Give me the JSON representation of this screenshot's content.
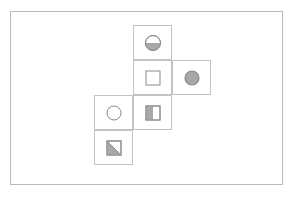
{
  "figure": {
    "title": "",
    "frame": {
      "border_color": "#b9b9b9",
      "background": "#ffffff",
      "x": 10,
      "y": 11,
      "width": 273,
      "height": 174
    },
    "cell": {
      "width": 39,
      "height": 35,
      "border_color": "#c3c3c3"
    },
    "grid_origin": {
      "x": 94,
      "y": 25
    },
    "colors": {
      "shape_outline": "#8a8a8a",
      "shape_fill": "#a8a8a8",
      "empty_fill": "#ffffff"
    },
    "cells": [
      {
        "id": "cell-r0c1",
        "row": 0,
        "col": 1,
        "shape": "circle",
        "fill_style": "bottom-half",
        "label": "half-filled-circle"
      },
      {
        "id": "cell-r1c1",
        "row": 1,
        "col": 1,
        "shape": "square",
        "fill_style": "none",
        "label": "empty-square"
      },
      {
        "id": "cell-r1c2",
        "row": 1,
        "col": 2,
        "shape": "circle",
        "fill_style": "full",
        "label": "filled-circle"
      },
      {
        "id": "cell-r2c0",
        "row": 2,
        "col": 0,
        "shape": "circle",
        "fill_style": "none",
        "label": "empty-circle"
      },
      {
        "id": "cell-r2c1",
        "row": 2,
        "col": 1,
        "shape": "square",
        "fill_style": "left-half",
        "label": "half-filled-square"
      },
      {
        "id": "cell-r3c0",
        "row": 3,
        "col": 0,
        "shape": "square",
        "fill_style": "diagonal-lower-left",
        "label": "diagonal-split-square"
      }
    ]
  }
}
